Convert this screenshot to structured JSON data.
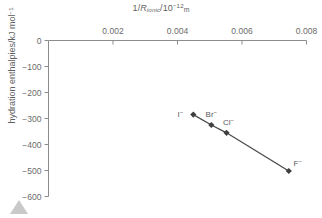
{
  "chart_data": {
    "type": "scatter",
    "title": "",
    "xlabel": "1/R_ionic/10^-12 m",
    "ylabel": "hydration enthalpies/kJ mol^-1",
    "xlabel_parts": {
      "prefix": "1/",
      "italic_var": "R",
      "subscript": "ionic",
      "slash": "/10",
      "exponent": "−12",
      "unit": "m"
    },
    "ylabel_parts": {
      "main": "hydration enthalpies/kJ mol",
      "exponent": "−1"
    },
    "xlim": [
      0,
      0.008
    ],
    "ylim": [
      -600,
      0
    ],
    "xticks": [
      0.002,
      0.004,
      0.006,
      0.008
    ],
    "xtick_labels": [
      "0.002",
      "0.004",
      "0.006",
      "0.008"
    ],
    "yticks": [
      0,
      -100,
      -200,
      -300,
      -400,
      -500,
      -600
    ],
    "ytick_labels": [
      "0",
      "−100",
      "−200",
      "−300",
      "−400",
      "−500",
      "−600"
    ],
    "grid": false,
    "legend": null,
    "x_axis_position": "top",
    "series": [
      {
        "name": "halide hydration enthalpies",
        "marker": "diamond",
        "line": true,
        "color": "#4a4a4a",
        "points": [
          {
            "ion": "I",
            "charge": "−",
            "x": 0.00449,
            "y": -285,
            "label": "I−",
            "label_dx": -13,
            "label_dy": -1
          },
          {
            "ion": "Br",
            "charge": "−",
            "x": 0.00505,
            "y": -325,
            "label": "Br−",
            "label_dx": 0,
            "label_dy": -11
          },
          {
            "ion": "Cl",
            "charge": "−",
            "x": 0.00552,
            "y": -355,
            "label": "Cl−",
            "label_dx": 2,
            "label_dy": -11
          },
          {
            "ion": "F",
            "charge": "−",
            "x": 0.00745,
            "y": -502,
            "label": "F−",
            "label_dx": 9,
            "label_dy": -8
          }
        ]
      }
    ],
    "colors": {
      "axis": "#8c8c8c",
      "marker": "#3f3f3f",
      "line": "#4a4a4a",
      "text": "#6b6b6b",
      "background": "#ffffff",
      "corner_triangle": "#c9c9c9"
    }
  },
  "decoration": {
    "corner_marker": "triangle-up"
  }
}
